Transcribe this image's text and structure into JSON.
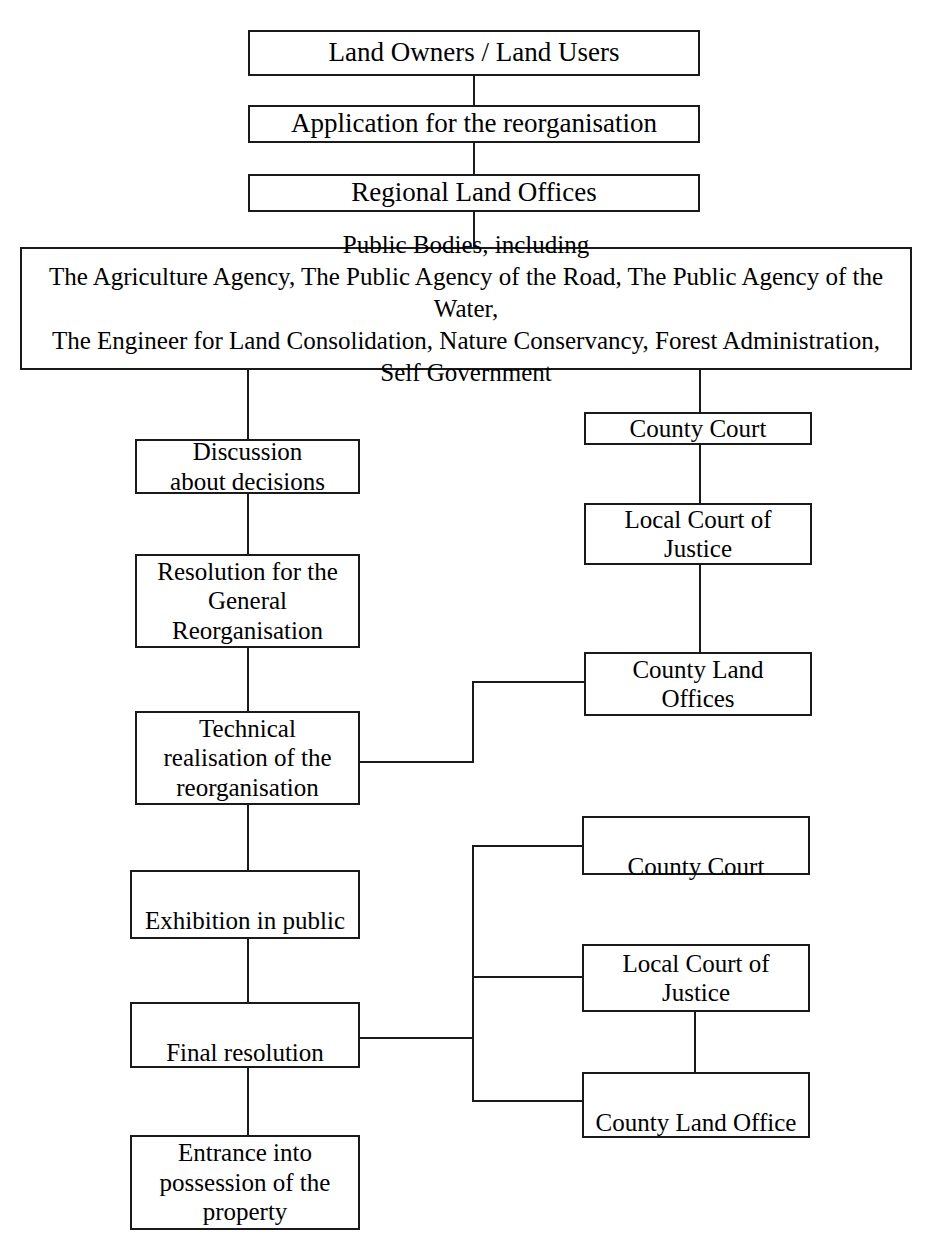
{
  "diagram": {
    "line_color": "#1a1a1a",
    "background": "#ffffff"
  },
  "nodes": {
    "land_owners": "Land Owners / Land Users",
    "application": "Application for the reorganisation",
    "regional_land_offices": "Regional Land Offices",
    "public_bodies": "Public Bodies, including\nThe Agriculture Agency, The Public Agency of the Road, The Public Agency of the Water,\nThe Engineer for Land Consolidation, Nature Conservancy, Forest Administration,\nSelf Government",
    "discussion": "Discussion\nabout decisions",
    "resolution_general": "Resolution for the\nGeneral\nReorganisation",
    "technical_realisation": "Technical\nrealisation of the\nreorganisation",
    "exhibition": "Exhibition in public",
    "final_resolution": "Final resolution",
    "entrance_possession": "Entrance into\npossession of the\nproperty",
    "county_court_upper": "County Court",
    "local_court_upper": "Local Court of\nJustice",
    "county_land_offices": "County Land\nOffices",
    "county_court_lower": "County Court",
    "local_court_lower": "Local Court of\nJustice",
    "county_land_office": "County Land Office"
  }
}
